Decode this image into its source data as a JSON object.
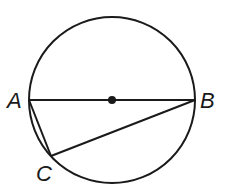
{
  "diagram": {
    "type": "circle-geometry",
    "circle": {
      "cx": 112,
      "cy": 100,
      "r": 83,
      "stroke": "#1a1a1a"
    },
    "center_point": {
      "x": 112,
      "y": 100
    },
    "points": [
      {
        "id": "A",
        "label": "A",
        "x": 29,
        "y": 100
      },
      {
        "id": "B",
        "label": "B",
        "x": 195,
        "y": 100
      },
      {
        "id": "C",
        "label": "C",
        "x": 51,
        "y": 156
      }
    ],
    "segments": [
      {
        "from": "A",
        "to": "B",
        "note": "diameter"
      },
      {
        "from": "A",
        "to": "C"
      },
      {
        "from": "C",
        "to": "B"
      }
    ],
    "labels": {
      "A": "A",
      "B": "B",
      "C": "C"
    }
  }
}
